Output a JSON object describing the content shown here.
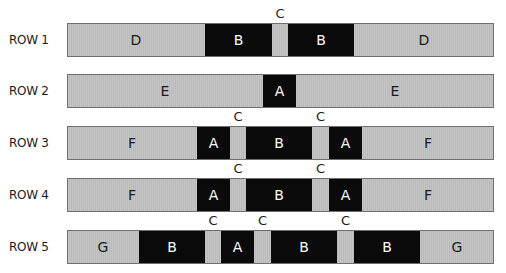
{
  "diagram": {
    "bar_x_start": 67,
    "bar_x_end": 494,
    "colors": {
      "light_segment": "#c2c2c2",
      "dark_segment": "#0a0a0a",
      "border": "#6f6f6f",
      "dark_text": "#ffffff",
      "light_text": "#1a1a1a"
    },
    "rows": [
      {
        "label": "ROW 1",
        "top": 23,
        "segments": [
          {
            "label": "D",
            "x0": 67,
            "x1": 205,
            "type": "light"
          },
          {
            "label": "B",
            "x0": 205,
            "x1": 272,
            "type": "dark"
          },
          {
            "label": "",
            "x0": 272,
            "x1": 288,
            "type": "light",
            "marker": "C"
          },
          {
            "label": "B",
            "x0": 288,
            "x1": 354,
            "type": "dark"
          },
          {
            "label": "D",
            "x0": 354,
            "x1": 494,
            "type": "light"
          }
        ]
      },
      {
        "label": "ROW 2",
        "top": 74,
        "segments": [
          {
            "label": "E",
            "x0": 67,
            "x1": 263,
            "type": "light"
          },
          {
            "label": "A",
            "x0": 263,
            "x1": 296,
            "type": "dark"
          },
          {
            "label": "E",
            "x0": 296,
            "x1": 494,
            "type": "light"
          }
        ]
      },
      {
        "label": "ROW 3",
        "top": 126,
        "segments": [
          {
            "label": "F",
            "x0": 67,
            "x1": 197,
            "type": "light"
          },
          {
            "label": "A",
            "x0": 197,
            "x1": 230,
            "type": "dark"
          },
          {
            "label": "",
            "x0": 230,
            "x1": 246,
            "type": "light",
            "marker": "C"
          },
          {
            "label": "B",
            "x0": 246,
            "x1": 312,
            "type": "dark"
          },
          {
            "label": "",
            "x0": 312,
            "x1": 329,
            "type": "light",
            "marker": "C"
          },
          {
            "label": "A",
            "x0": 329,
            "x1": 362,
            "type": "dark"
          },
          {
            "label": "F",
            "x0": 362,
            "x1": 494,
            "type": "light"
          }
        ]
      },
      {
        "label": "ROW 4",
        "top": 178,
        "segments": [
          {
            "label": "F",
            "x0": 67,
            "x1": 197,
            "type": "light"
          },
          {
            "label": "A",
            "x0": 197,
            "x1": 230,
            "type": "dark"
          },
          {
            "label": "",
            "x0": 230,
            "x1": 246,
            "type": "light",
            "marker": "C"
          },
          {
            "label": "B",
            "x0": 246,
            "x1": 312,
            "type": "dark"
          },
          {
            "label": "",
            "x0": 312,
            "x1": 329,
            "type": "light",
            "marker": "C"
          },
          {
            "label": "A",
            "x0": 329,
            "x1": 362,
            "type": "dark"
          },
          {
            "label": "F",
            "x0": 362,
            "x1": 494,
            "type": "light"
          }
        ]
      },
      {
        "label": "ROW 5",
        "top": 230,
        "segments": [
          {
            "label": "G",
            "x0": 67,
            "x1": 139,
            "type": "light"
          },
          {
            "label": "B",
            "x0": 139,
            "x1": 205,
            "type": "dark"
          },
          {
            "label": "",
            "x0": 205,
            "x1": 221,
            "type": "light",
            "marker": "C"
          },
          {
            "label": "A",
            "x0": 221,
            "x1": 254,
            "type": "dark"
          },
          {
            "label": "",
            "x0": 254,
            "x1": 271,
            "type": "light",
            "marker": "C"
          },
          {
            "label": "B",
            "x0": 271,
            "x1": 337,
            "type": "dark"
          },
          {
            "label": "",
            "x0": 337,
            "x1": 354,
            "type": "light",
            "marker": "C"
          },
          {
            "label": "B",
            "x0": 354,
            "x1": 420,
            "type": "dark"
          },
          {
            "label": "G",
            "x0": 420,
            "x1": 494,
            "type": "light"
          }
        ]
      }
    ]
  }
}
